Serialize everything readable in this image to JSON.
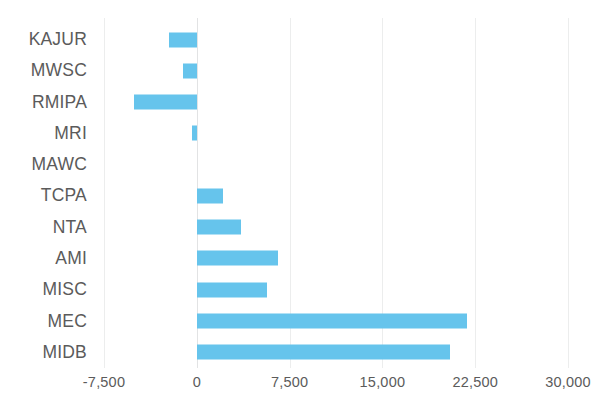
{
  "chart_data": {
    "type": "bar",
    "orientation": "horizontal",
    "title": "",
    "subtitle": "",
    "xlabel": "",
    "ylabel": "",
    "categories": [
      "KAJUR",
      "MWSC",
      "RMIPA",
      "MRI",
      "MAWC",
      "TCPA",
      "NTA",
      "AMI",
      "MISC",
      "MEC",
      "MIDB"
    ],
    "values": [
      -2250,
      -1150,
      -5100,
      -350,
      0,
      2100,
      3550,
      6550,
      5700,
      21800,
      20500
    ],
    "series": [
      {
        "name": "",
        "values": [
          -2250,
          -1150,
          -5100,
          -350,
          0,
          2100,
          3550,
          6550,
          5700,
          21800,
          20500
        ]
      }
    ],
    "xlim": [
      -7500,
      30000
    ],
    "xticks": [
      -7500,
      0,
      7500,
      15000,
      22500,
      30000
    ],
    "xtick_labels": [
      "-7,500",
      "0",
      "7,500",
      "15,000",
      "22,500",
      "30,000"
    ],
    "grid": true,
    "grid_axis": "x",
    "legend": false,
    "legend_position": "none",
    "bar_color": "#66c4ec",
    "grid_color": "#eceded",
    "text_color": "#5b5b5b",
    "background_color": "#ffffff"
  }
}
